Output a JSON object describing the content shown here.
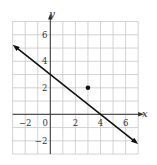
{
  "diagram": {
    "type": "coordinate-plane",
    "axes": {
      "x_label": "x",
      "y_label": "y"
    },
    "x_range": [
      -3,
      7
    ],
    "y_range": [
      -3,
      7
    ],
    "x_ticks": [
      {
        "value": -2,
        "label": "−2"
      },
      {
        "value": 0,
        "label": "0"
      },
      {
        "value": 2,
        "label": "2"
      },
      {
        "value": 4,
        "label": "4"
      },
      {
        "value": 6,
        "label": "6"
      }
    ],
    "y_ticks": [
      {
        "value": 6,
        "label": "6"
      },
      {
        "value": 4,
        "label": "4"
      },
      {
        "value": 2,
        "label": "2"
      },
      {
        "value": -2,
        "label": "−2"
      }
    ],
    "line": {
      "through": [
        [
          0,
          3
        ],
        [
          4,
          0
        ]
      ],
      "equation": "y = -3/4 x + 3",
      "from": [
        -3,
        5.25
      ],
      "to": [
        7,
        -2.25
      ],
      "arrows": "both"
    },
    "point": {
      "x": 3,
      "y": 2
    },
    "colors": {
      "grid": "#c8c8c8",
      "axis": "#333333",
      "line": "#111111",
      "point": "#111111"
    }
  }
}
